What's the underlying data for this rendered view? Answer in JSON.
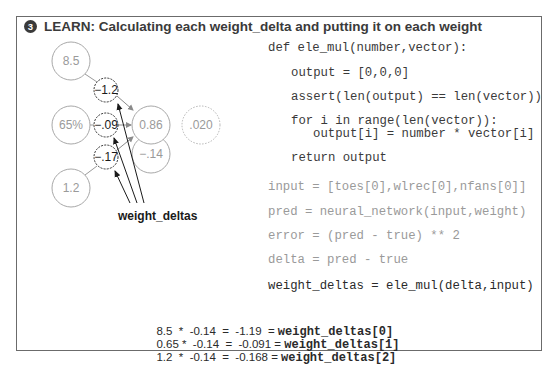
{
  "title": {
    "step_number": "3",
    "text": "LEARN: Calculating each weight_delta and putting it on each weight"
  },
  "diagram": {
    "inputs": [
      {
        "label": "8.5"
      },
      {
        "label": "65%"
      },
      {
        "label": "1.2"
      }
    ],
    "weight_deltas": [
      {
        "label": "−1.2"
      },
      {
        "label": "−.09"
      },
      {
        "label": "−.17"
      }
    ],
    "prediction": {
      "label": "0.86"
    },
    "delta": {
      "label": "−.14"
    },
    "error": {
      "label": ".020"
    },
    "weight_deltas_label": "weight_deltas"
  },
  "code": {
    "function_def": [
      "def ele_mul(number,vector):",
      "output = [0,0,0]",
      "assert(len(output) == len(vector))",
      "for i in range(len(vector)):",
      "output[i] = number * vector[i]",
      "return output"
    ],
    "main": [
      "input = [toes[0],wlrec[0],nfans[0]]",
      "pred = neural_network(input,weight)",
      "error = (pred - true) ** 2",
      "delta = pred - true",
      "weight_deltas = ele_mul(delta,input)"
    ]
  },
  "calculations": [
    {
      "expr": "8.5  *  -0.14  =  -1.19  = ",
      "result": "weight_deltas[0]"
    },
    {
      "expr": "0.65 *  -0.14  =  -0.091 = ",
      "result": "weight_deltas[1]"
    },
    {
      "expr": "1.2  *  -0.14  =  -0.168 = ",
      "result": "weight_deltas[2]"
    }
  ],
  "colors": {
    "border": "#6b6b6b",
    "node_gray": "#a8a8a8",
    "node_text_gray": "#9a9a9a",
    "dark": "#2a2a2a"
  }
}
